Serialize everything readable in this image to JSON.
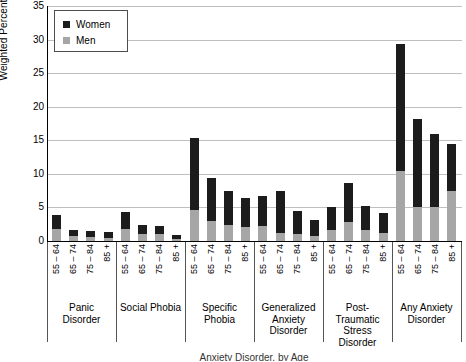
{
  "chart_data": {
    "type": "bar",
    "subtype": "stacked-grouped-vertical",
    "title": "",
    "xlabel": "Anxiety Disorder, by Age",
    "ylabel": "Weighted Percent",
    "ylim": [
      0,
      35
    ],
    "ytick_values": [
      0,
      5,
      10,
      15,
      20,
      25,
      30,
      35
    ],
    "ytick_labels": [
      "0",
      "5",
      "10",
      "15",
      "20",
      "25",
      "30",
      "35"
    ],
    "grid": "horizontal",
    "legend": {
      "position": "top-left-inside",
      "entries": [
        {
          "name": "Women",
          "color": "#1c1c1c"
        },
        {
          "name": "Men",
          "color": "#a6a6a6"
        }
      ]
    },
    "age_categories": [
      "55 – 64",
      "65 – 74",
      "75 – 84",
      "85 +"
    ],
    "groups": [
      {
        "label": "Panic Disorder",
        "label_lines": [
          "Panic",
          "Disorder"
        ],
        "bars": [
          {
            "age": "55 – 64",
            "total": 3.9,
            "men": 1.8,
            "women": 2.1
          },
          {
            "age": "65 – 74",
            "total": 1.6,
            "men": 0.7,
            "women": 0.9
          },
          {
            "age": "75 – 84",
            "total": 1.5,
            "men": 0.6,
            "women": 0.9
          },
          {
            "age": "85 +",
            "total": 1.3,
            "men": 0.5,
            "women": 0.8
          }
        ]
      },
      {
        "label": "Social Phobia",
        "label_lines": [
          "Social Phobia"
        ],
        "bars": [
          {
            "age": "55 – 64",
            "total": 4.3,
            "men": 1.8,
            "women": 2.5
          },
          {
            "age": "65 – 74",
            "total": 2.4,
            "men": 1.0,
            "women": 1.4
          },
          {
            "age": "75 – 84",
            "total": 2.2,
            "men": 1.0,
            "women": 1.2
          },
          {
            "age": "85 +",
            "total": 0.9,
            "men": 0.3,
            "women": 0.6
          }
        ]
      },
      {
        "label": "Specific Phobia",
        "label_lines": [
          "Specific",
          "Phobia"
        ],
        "bars": [
          {
            "age": "55 – 64",
            "total": 15.3,
            "men": 4.6,
            "women": 10.7
          },
          {
            "age": "65 – 74",
            "total": 9.4,
            "men": 3.0,
            "women": 6.4
          },
          {
            "age": "75 – 84",
            "total": 7.5,
            "men": 2.4,
            "women": 5.1
          },
          {
            "age": "85 +",
            "total": 6.4,
            "men": 2.1,
            "women": 4.3
          }
        ]
      },
      {
        "label": "Generalized Anxiety Disorder",
        "label_lines": [
          "Generalized",
          "Anxiety",
          "Disorder"
        ],
        "bars": [
          {
            "age": "55 – 64",
            "total": 6.7,
            "men": 2.3,
            "women": 4.4
          },
          {
            "age": "65 – 74",
            "total": 7.5,
            "men": 1.2,
            "women": 6.3
          },
          {
            "age": "75 – 84",
            "total": 4.5,
            "men": 1.1,
            "women": 3.4
          },
          {
            "age": "85 +",
            "total": 3.2,
            "men": 0.7,
            "women": 2.5
          }
        ]
      },
      {
        "label": "Post-Traumatic Stress Disorder",
        "label_lines": [
          "Post-",
          "Traumatic",
          "Stress",
          "Disorder"
        ],
        "bars": [
          {
            "age": "55 – 64",
            "total": 5.1,
            "men": 1.7,
            "women": 3.4
          },
          {
            "age": "65 – 74",
            "total": 8.6,
            "men": 2.8,
            "women": 5.8
          },
          {
            "age": "75 – 84",
            "total": 5.2,
            "men": 1.6,
            "women": 3.6
          },
          {
            "age": "85 +",
            "total": 4.2,
            "men": 1.2,
            "women": 3.0
          }
        ]
      },
      {
        "label": "Any Anxiety Disorder",
        "label_lines": [
          "Any Anxiety",
          "Disorder"
        ],
        "bars": [
          {
            "age": "55 – 64",
            "total": 29.4,
            "men": 10.4,
            "women": 19.0
          },
          {
            "age": "65 – 74",
            "total": 18.1,
            "men": 5.1,
            "women": 13.0
          },
          {
            "age": "75 – 84",
            "total": 16.0,
            "men": 5.0,
            "women": 11.0
          },
          {
            "age": "85 +",
            "total": 14.4,
            "men": 7.4,
            "women": 7.0
          }
        ]
      }
    ]
  }
}
